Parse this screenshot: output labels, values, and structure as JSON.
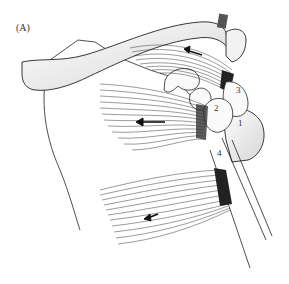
{
  "figure": {
    "panel_label": "(A)",
    "labels": [
      {
        "id": "1",
        "text": "1",
        "x": 238,
        "y": 125
      },
      {
        "id": "2",
        "text": "2",
        "x": 216,
        "y": 109
      },
      {
        "id": "3",
        "text": "3",
        "x": 236,
        "y": 89
      },
      {
        "id": "4",
        "text": "4",
        "x": 215,
        "y": 152
      }
    ],
    "colors": {
      "line": "#222222",
      "shade": "#d8d8d8",
      "background": "#ffffff"
    }
  }
}
